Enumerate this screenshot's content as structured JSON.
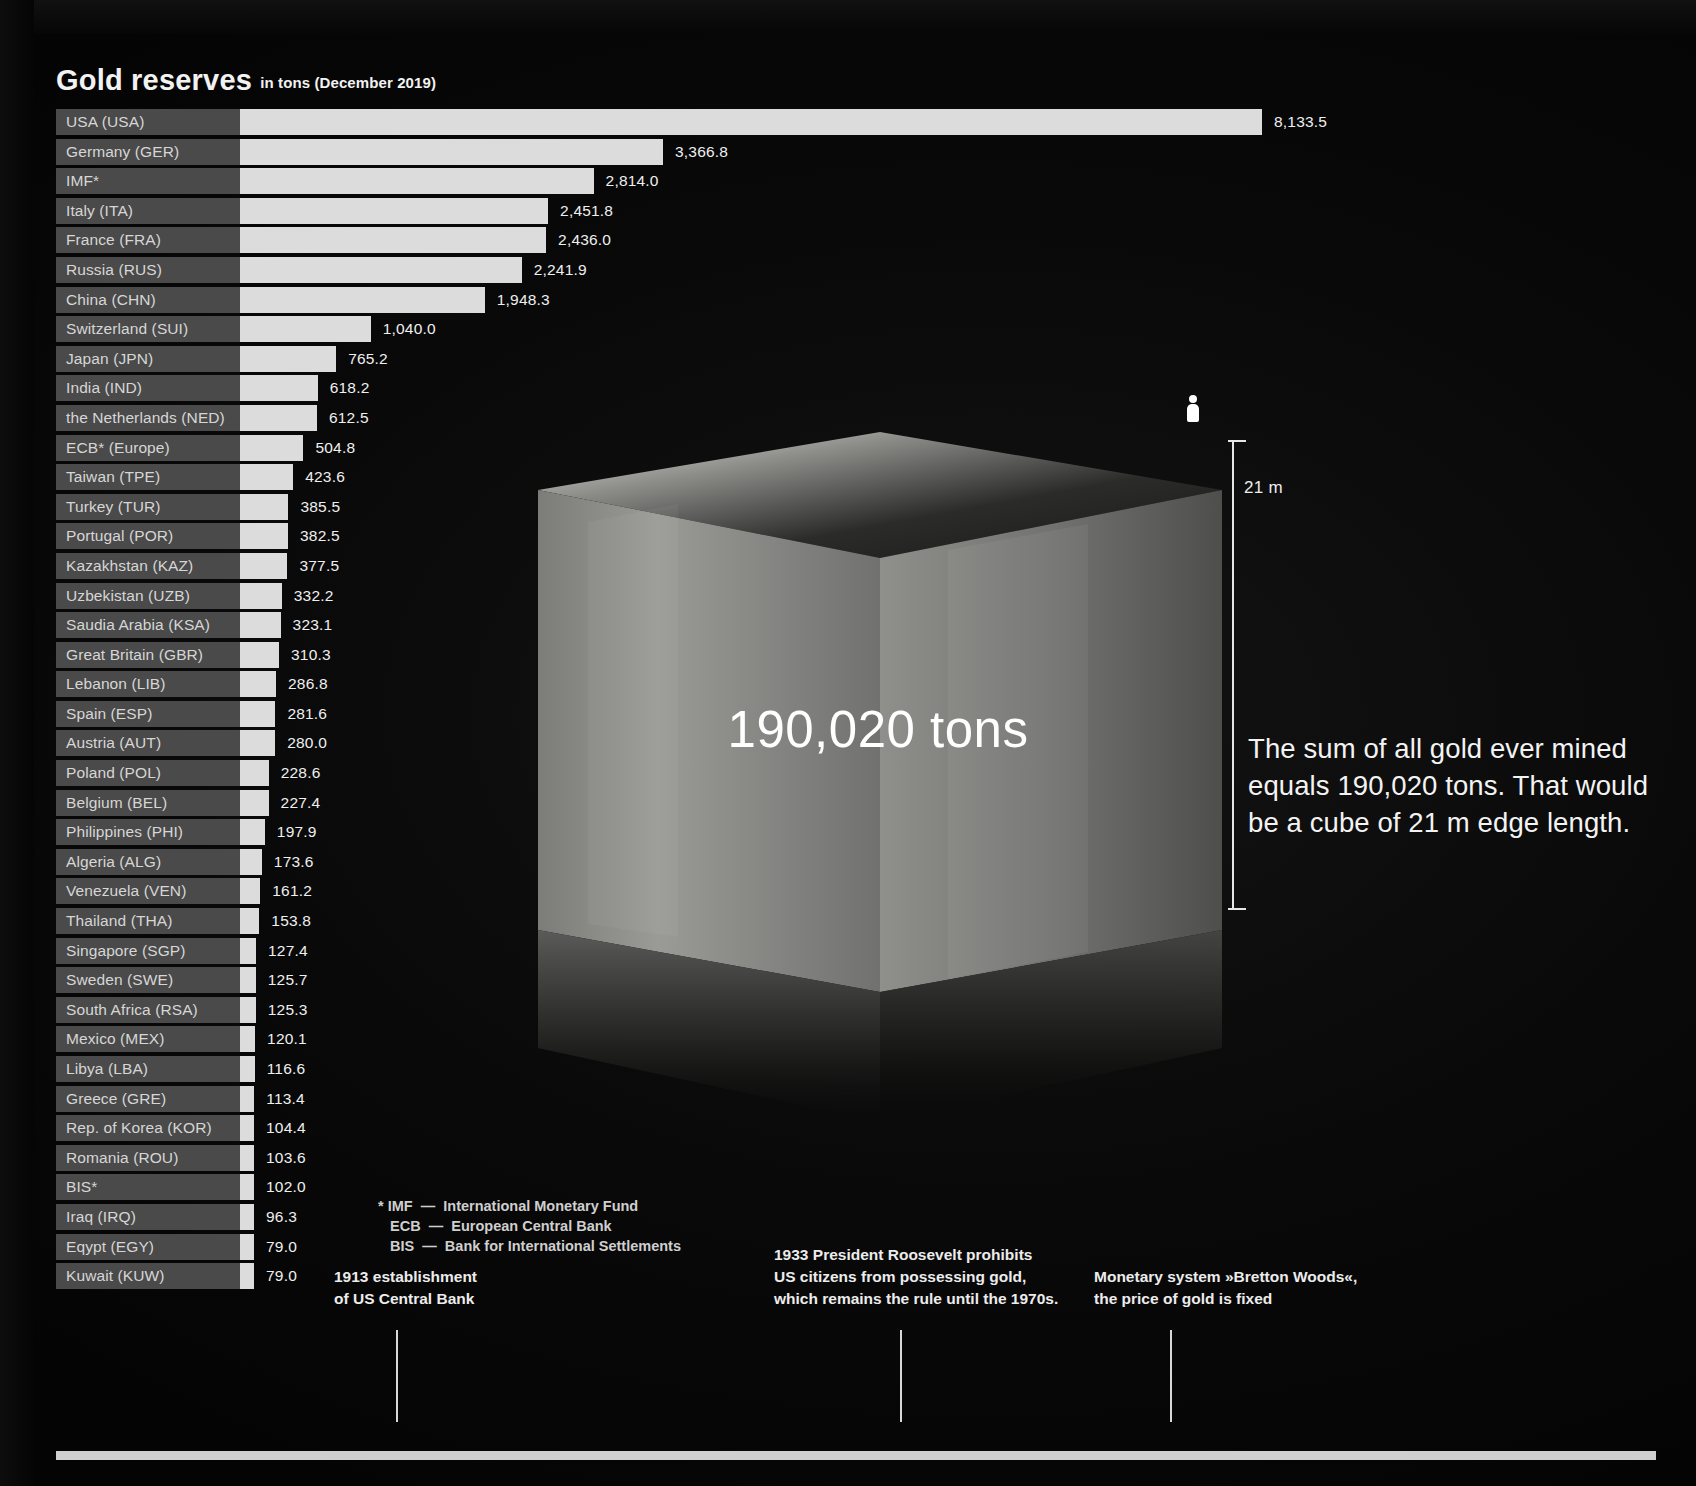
{
  "chart_data": {
    "type": "bar",
    "title": "Gold reserves",
    "subtitle": "in tons (December 2019)",
    "xlabel": "",
    "ylabel": "",
    "orientation": "horizontal",
    "grid": false,
    "legend": "none",
    "max_value": 8133.5,
    "categories": [
      "USA (USA)",
      "Germany (GER)",
      "IMF*",
      "Italy (ITA)",
      "France (FRA)",
      "Russia (RUS)",
      "China (CHN)",
      "Switzerland (SUI)",
      "Japan (JPN)",
      "India (IND)",
      "the Netherlands (NED)",
      "ECB* (Europe)",
      "Taiwan (TPE)",
      "Turkey (TUR)",
      "Portugal (POR)",
      "Kazakhstan (KAZ)",
      "Uzbekistan  (UZB)",
      "Saudia Arabia (KSA)",
      "Great Britain (GBR)",
      "Lebanon (LIB)",
      "Spain (ESP)",
      "Austria (AUT)",
      "Poland (POL)",
      "Belgium (BEL)",
      "Philippines (PHI)",
      "Algeria (ALG)",
      "Venezuela (VEN)",
      "Thailand (THA)",
      "Singapore (SGP)",
      "Sweden (SWE)",
      "South Africa (RSA)",
      "Mexico (MEX)",
      "Libya (LBA)",
      "Greece (GRE)",
      "Rep. of Korea (KOR)",
      "Romania (ROU)",
      "BIS*",
      "Iraq (IRQ)",
      "Eqypt (EGY)",
      "Kuwait (KUW)"
    ],
    "values": [
      8133.5,
      3366.8,
      2814.0,
      2451.8,
      2436.0,
      2241.9,
      1948.3,
      1040.0,
      765.2,
      618.2,
      612.5,
      504.8,
      423.6,
      385.5,
      382.5,
      377.5,
      332.2,
      323.1,
      310.3,
      286.8,
      281.6,
      280.0,
      228.6,
      227.4,
      197.9,
      173.6,
      161.2,
      153.8,
      127.4,
      125.7,
      125.3,
      120.1,
      116.6,
      113.4,
      104.4,
      103.6,
      102.0,
      96.3,
      79.0,
      79.0
    ],
    "labels": [
      "8,133.5",
      "3,366.8",
      "2,814.0",
      "2,451.8",
      "2,436.0",
      "2,241.9",
      "1,948.3",
      "1,040.0",
      "765.2",
      "618.2",
      "612.5",
      "504.8",
      "423.6",
      "385.5",
      "382.5",
      "377.5",
      "332.2",
      "323.1",
      "310.3",
      "286.8",
      "281.6",
      "280.0",
      "228.6",
      "227.4",
      "197.9",
      "173.6",
      "161.2",
      "153.8",
      "127.4",
      "125.7",
      "125.3",
      "120.1",
      "116.6",
      "113.4",
      "104.4",
      "103.6",
      "102.0",
      "96.3",
      "79.0",
      "79.0"
    ],
    "colors": {
      "bar": "#dcdcdc",
      "label_block": "#4a4a4a",
      "background": "#050505",
      "text": "#eeeeee"
    }
  },
  "footnote": "* IMF  —  International Monetary Fund\n   ECB  —  European Central Bank\n   BIS  —  Bank for International Settlements",
  "cube": {
    "amount_label": "190,020 tons",
    "dimension_label": "21 m",
    "caption": "The sum of all gold ever mined equals 190,020 tons. That would be a cube of 21 m edge length.",
    "person_icon": "person-icon"
  },
  "timeline": {
    "events": [
      {
        "text": "1913 establishment\nof US Central Bank"
      },
      {
        "text": "1933 President Roosevelt prohibits\nUS citizens from possessing gold,\nwhich remains the rule until the 1970s."
      },
      {
        "text": "Monetary system »Bretton Woods«,\nthe price of gold is fixed"
      }
    ]
  }
}
